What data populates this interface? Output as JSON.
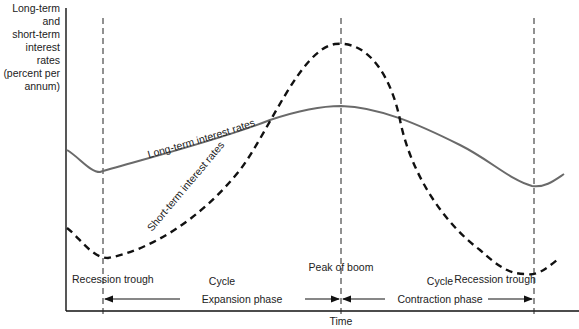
{
  "diagram": {
    "y_axis_label": [
      "Long-term",
      "and",
      "short-term",
      "interest rates",
      "(percent per",
      "annum)"
    ],
    "x_axis_label": "Time",
    "curves": {
      "long_term": {
        "label": "Long-term interest rates",
        "style": "solid",
        "color": "#666666"
      },
      "short_term": {
        "label": "Short-term interest rates",
        "style": "dashed",
        "color": "#111111"
      }
    },
    "markers": {
      "trough_left": "Recession trough",
      "peak": "Peak of boom",
      "trough_right": "Recession trough"
    },
    "phases": {
      "expansion": {
        "cycle_label": "Cycle",
        "label": "Expansion phase"
      },
      "contraction": {
        "cycle_label": "Cycle",
        "label": "Contraction phase"
      }
    }
  }
}
